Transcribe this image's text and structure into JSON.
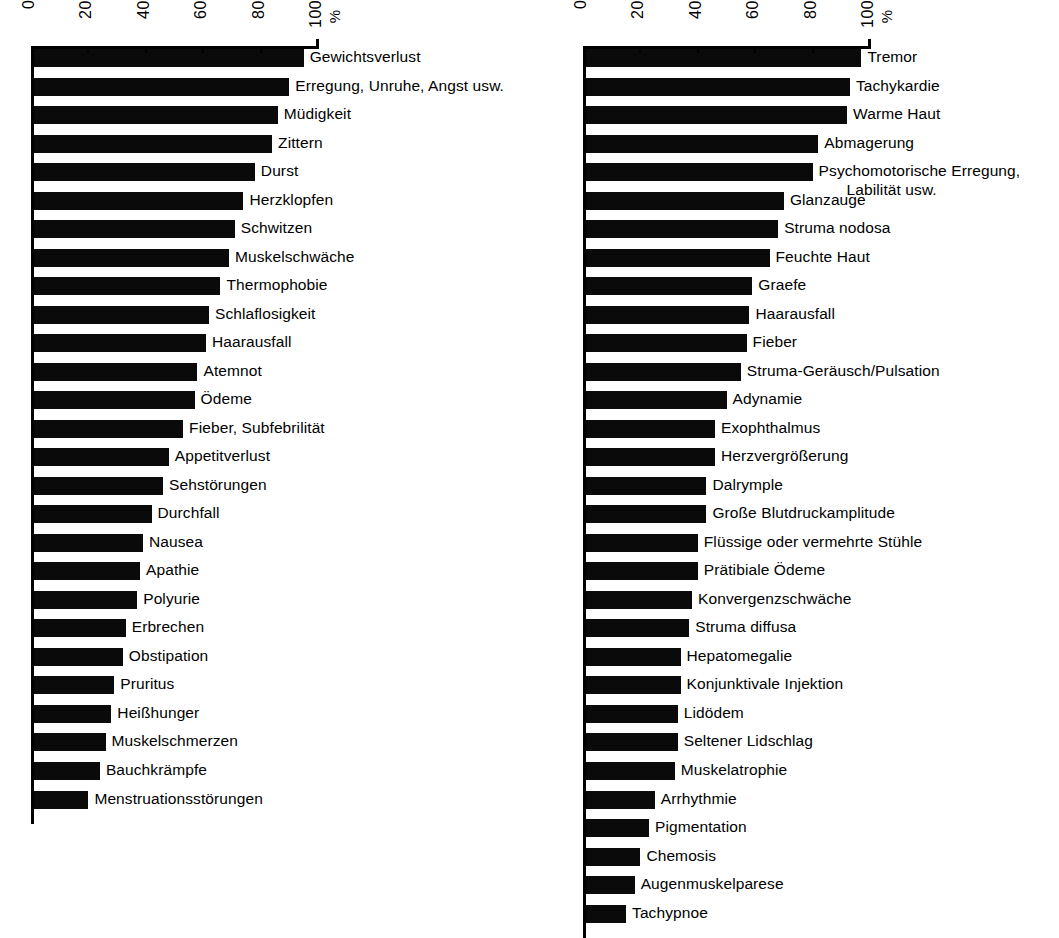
{
  "chart_data": [
    {
      "id": "left",
      "type": "bar",
      "orientation": "horizontal",
      "title": "",
      "xlabel": "%",
      "ylabel": "",
      "xlim": [
        0,
        100
      ],
      "xticks": [
        0,
        20,
        40,
        60,
        80,
        100
      ],
      "xticklabels": [
        "0",
        "20",
        "40",
        "60",
        "80",
        "100"
      ],
      "unit_label": "%",
      "grid": false,
      "legend": null,
      "bar_color": "#0a0a0a",
      "categories": [
        "Gewichtsverlust",
        "Erregung, Unruhe, Angst usw.",
        "Müdigkeit",
        "Zittern",
        "Durst",
        "Herzklopfen",
        "Schwitzen",
        "Muskelschwäche",
        "Thermophobie",
        "Schlaflosigkeit",
        "Haarausfall",
        "Atemnot",
        "Ödeme",
        "Fieber, Subfebrilität",
        "Appetitverlust",
        "Sehstörungen",
        "Durchfall",
        "Nausea",
        "Apathie",
        "Polyurie",
        "Erbrechen",
        "Obstipation",
        "Pruritus",
        "Heißhunger",
        "Muskelschmerzen",
        "Bauchkrämpfe",
        "Menstruationsstörungen"
      ],
      "values": [
        95,
        90,
        86,
        84,
        78,
        74,
        71,
        69,
        66,
        62,
        61,
        58,
        57,
        53,
        48,
        46,
        42,
        39,
        38,
        37,
        33,
        32,
        29,
        28,
        26,
        24,
        20
      ]
    },
    {
      "id": "right",
      "type": "bar",
      "orientation": "horizontal",
      "title": "",
      "xlabel": "%",
      "ylabel": "",
      "xlim": [
        0,
        100
      ],
      "xticks": [
        0,
        20,
        40,
        60,
        80,
        100
      ],
      "xticklabels": [
        "0",
        "20",
        "40",
        "60",
        "80",
        "100"
      ],
      "unit_label": "%",
      "grid": false,
      "legend": null,
      "bar_color": "#0a0a0a",
      "categories": [
        "Tremor",
        "Tachykardie",
        "Warme Haut",
        "Abmagerung",
        "Psychomotorische Erregung,|Labilität usw.",
        "Glanzauge",
        "Struma nodosa",
        "Feuchte Haut",
        "Graefe",
        "Haarausfall",
        "Fieber",
        "Struma-Geräusch/Pulsation",
        "Adynamie",
        "Exophthalmus",
        "Herzvergrößerung",
        "Dalrymple",
        "Große Blutdruckamplitude",
        "Flüssige oder vermehrte Stühle",
        "Prätibiale Ödeme",
        "Konvergenzschwäche",
        "Struma diffusa",
        "Hepatomegalie",
        "Konjunktivale Injektion",
        "Lidödem",
        "Seltener Lidschlag",
        "Muskelatrophie",
        "Arrhythmie",
        "Pigmentation",
        "Chemosis",
        "Augenmuskelparese",
        "Tachypnoe"
      ],
      "values": [
        97,
        93,
        92,
        82,
        80,
        70,
        68,
        65,
        59,
        58,
        57,
        55,
        50,
        46,
        46,
        43,
        43,
        40,
        40,
        38,
        37,
        34,
        34,
        33,
        33,
        32,
        25,
        23,
        20,
        18,
        15
      ]
    }
  ]
}
